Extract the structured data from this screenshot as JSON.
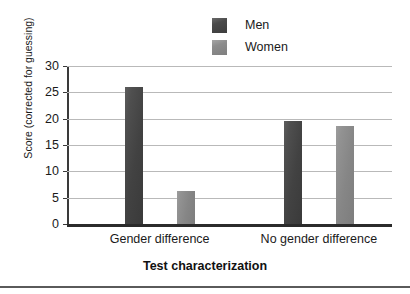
{
  "chart_data": {
    "type": "bar",
    "title": "",
    "xlabel": "Test characterization",
    "ylabel": "Score (corrected for guessing)",
    "categories": [
      "Gender difference",
      "No gender difference"
    ],
    "series": [
      {
        "name": "Men",
        "values": [
          26.0,
          19.6
        ],
        "color": "#474747"
      },
      {
        "name": "Women",
        "values": [
          6.2,
          18.7
        ],
        "color": "#8c8c8c"
      }
    ],
    "ylim": [
      0,
      30
    ],
    "ytick_values": [
      0,
      5,
      10,
      15,
      20,
      25,
      30
    ],
    "ytick_labels": [
      "0",
      "5",
      "10",
      "15",
      "20",
      "25",
      "30"
    ],
    "grid": "horizontal",
    "legend_position": "top-center-right"
  },
  "legend": {
    "items": [
      {
        "label": "Men",
        "swatch": "men-swatch"
      },
      {
        "label": "Women",
        "swatch": "women-swatch"
      }
    ]
  },
  "axes": {
    "y_title": "Score (corrected for guessing)",
    "x_title": "Test characterization"
  }
}
